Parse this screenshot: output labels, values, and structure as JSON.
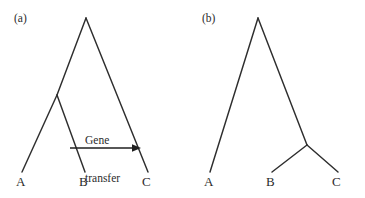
{
  "figure": {
    "background_color": "#ffffff",
    "line_color": "#2e2e2e",
    "text_color": "#2b2b2b",
    "width": 365,
    "height": 198
  },
  "panels": [
    {
      "id": "a",
      "label": "(a)",
      "label_pos": {
        "x": 14,
        "y": 12
      },
      "type": "phylogenetic-tree-with-gene-transfer",
      "tips": [
        {
          "name": "A",
          "label": "A",
          "tip_x": 22,
          "tip_y": 172,
          "label_x": 16,
          "label_y": 175
        },
        {
          "name": "B",
          "label": "B",
          "tip_x": 85,
          "tip_y": 172,
          "label_x": 79,
          "label_y": 175
        },
        {
          "name": "C",
          "label": "C",
          "tip_x": 148,
          "tip_y": 172,
          "label_x": 142,
          "label_y": 175
        }
      ],
      "nodes": [
        {
          "name": "root",
          "x": 86,
          "y": 18
        },
        {
          "name": "ab-ancestor",
          "x": 57,
          "y": 95
        }
      ],
      "branches": [
        {
          "from": "root",
          "to": "ab-ancestor",
          "x1": 86,
          "y1": 18,
          "x2": 57,
          "y2": 95
        },
        {
          "from": "root",
          "to": "C",
          "x1": 86,
          "y1": 18,
          "x2": 148,
          "y2": 172
        },
        {
          "from": "ab-ancestor",
          "to": "A",
          "x1": 57,
          "y1": 95,
          "x2": 22,
          "y2": 172
        },
        {
          "from": "ab-ancestor",
          "to": "B",
          "x1": 57,
          "y1": 95,
          "x2": 85,
          "y2": 172
        }
      ],
      "annotation": {
        "name": "gene-transfer",
        "line1": "Gene",
        "line2": "transfer",
        "text_x": 85,
        "text_y": 110,
        "arrow": {
          "x1": 70,
          "y1": 148,
          "x2": 141,
          "y2": 148,
          "direction": "left-to-right"
        }
      }
    },
    {
      "id": "b",
      "label": "(b)",
      "label_pos": {
        "x": 202,
        "y": 12
      },
      "type": "phylogenetic-tree",
      "tips": [
        {
          "name": "A",
          "label": "A",
          "tip_x": 210,
          "tip_y": 172,
          "label_x": 204,
          "label_y": 175
        },
        {
          "name": "B",
          "label": "B",
          "tip_x": 272,
          "tip_y": 172,
          "label_x": 266,
          "label_y": 175
        },
        {
          "name": "C",
          "label": "C",
          "tip_x": 338,
          "tip_y": 172,
          "label_x": 332,
          "label_y": 175
        }
      ],
      "nodes": [
        {
          "name": "root",
          "x": 258,
          "y": 18
        },
        {
          "name": "bc-ancestor",
          "x": 307,
          "y": 145
        }
      ],
      "branches": [
        {
          "from": "root",
          "to": "A",
          "x1": 258,
          "y1": 18,
          "x2": 210,
          "y2": 172
        },
        {
          "from": "root",
          "to": "bc-ancestor",
          "x1": 258,
          "y1": 18,
          "x2": 307,
          "y2": 145
        },
        {
          "from": "bc-ancestor",
          "to": "B",
          "x1": 307,
          "y1": 145,
          "x2": 272,
          "y2": 172
        },
        {
          "from": "bc-ancestor",
          "to": "C",
          "x1": 307,
          "y1": 145,
          "x2": 338,
          "y2": 172
        }
      ]
    }
  ]
}
